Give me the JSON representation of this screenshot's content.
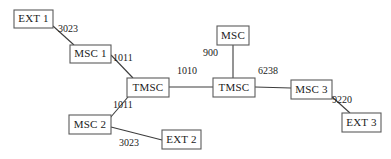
{
  "diagram": {
    "type": "telecom-network-topology",
    "background_color": "#ffffff",
    "node_stroke_color": "#5b5b5b",
    "link_stroke_color": "#3c3c3c",
    "text_color": "#1a1a1a",
    "nodes": [
      {
        "id": "ext1",
        "label": "EXT 1",
        "x": 14,
        "y": 10,
        "w": 39,
        "h": 18
      },
      {
        "id": "msc1",
        "label": "MSC 1",
        "x": 70,
        "y": 45,
        "w": 41,
        "h": 18
      },
      {
        "id": "tmsc1",
        "label": "TMSC",
        "x": 127,
        "y": 78,
        "w": 42,
        "h": 19
      },
      {
        "id": "msc2",
        "label": "MSC 2",
        "x": 69,
        "y": 115,
        "w": 42,
        "h": 19
      },
      {
        "id": "ext2",
        "label": "EXT 2",
        "x": 162,
        "y": 130,
        "w": 39,
        "h": 19
      },
      {
        "id": "msctop",
        "label": "MSC",
        "x": 217,
        "y": 26,
        "w": 32,
        "h": 19
      },
      {
        "id": "tmsc2",
        "label": "TMSC",
        "x": 213,
        "y": 78,
        "w": 42,
        "h": 19
      },
      {
        "id": "msc3",
        "label": "MSC 3",
        "x": 291,
        "y": 80,
        "w": 41,
        "h": 19
      },
      {
        "id": "ext3",
        "label": "EXT 3",
        "x": 342,
        "y": 113,
        "w": 39,
        "h": 19
      }
    ],
    "links": [
      {
        "id": "link-ext1-msc1",
        "from": "EXT 1",
        "to": "MSC 1",
        "label": "3023",
        "x1": 53,
        "y1": 26,
        "x2": 74,
        "y2": 45,
        "label_x": 58,
        "label_y": 30
      },
      {
        "id": "link-msc1-tmsc1",
        "from": "MSC 1",
        "to": "TMSC",
        "label": "1011",
        "x1": 111,
        "y1": 55,
        "x2": 133,
        "y2": 78,
        "label_x": 113,
        "label_y": 59
      },
      {
        "id": "link-tmsc1-msc2",
        "from": "TMSC",
        "to": "MSC 2",
        "label": "1011",
        "x1": 128,
        "y1": 97,
        "x2": 110,
        "y2": 118,
        "label_x": 113,
        "label_y": 106
      },
      {
        "id": "link-msc2-ext2",
        "from": "MSC 2",
        "to": "EXT 2",
        "label": "3023",
        "x1": 111,
        "y1": 127,
        "x2": 162,
        "y2": 140,
        "label_x": 119,
        "label_y": 144
      },
      {
        "id": "link-tmsc1-tmsc2",
        "from": "TMSC",
        "to": "TMSC",
        "label": "1010",
        "x1": 169,
        "y1": 87,
        "x2": 213,
        "y2": 87,
        "label_x": 177,
        "label_y": 72
      },
      {
        "id": "link-msctop-tmsc2",
        "from": "MSC",
        "to": "TMSC",
        "label": "900",
        "x1": 233,
        "y1": 45,
        "x2": 233,
        "y2": 78,
        "label_x": 203,
        "label_y": 54
      },
      {
        "id": "link-tmsc2-msc3",
        "from": "TMSC",
        "to": "MSC 3",
        "label": "6238",
        "x1": 255,
        "y1": 87,
        "x2": 291,
        "y2": 88,
        "label_x": 258,
        "label_y": 72
      },
      {
        "id": "link-msc3-ext3",
        "from": "MSC 3",
        "to": "EXT 3",
        "label": "9220",
        "x1": 330,
        "y1": 95,
        "x2": 350,
        "y2": 113,
        "label_x": 332,
        "label_y": 101
      }
    ]
  }
}
